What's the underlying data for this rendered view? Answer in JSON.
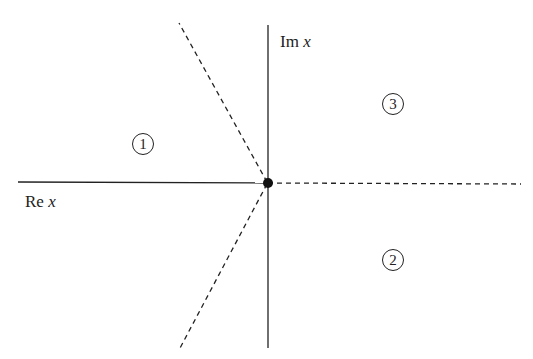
{
  "diagram": {
    "axes": {
      "imaginary_label": "Im",
      "imaginary_var": "x",
      "real_label": "Re",
      "real_var": "x"
    },
    "origin_point": "branch-point",
    "regions": [
      {
        "id": "1",
        "label": "1"
      },
      {
        "id": "2",
        "label": "2"
      },
      {
        "id": "3",
        "label": "3"
      }
    ],
    "lines": {
      "solid": [
        "negative real axis",
        "imaginary axis"
      ],
      "dashed": [
        "positive real axis",
        "upper-left ray",
        "lower-left ray"
      ]
    }
  }
}
